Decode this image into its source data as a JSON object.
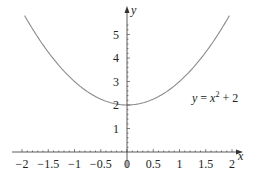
{
  "chart_data": {
    "type": "line",
    "title": "",
    "xlabel": "x",
    "ylabel": "y",
    "xlim": [
      -2,
      2
    ],
    "ylim": [
      0,
      5.7
    ],
    "grid": false,
    "legend": null,
    "x_ticks": [
      -2,
      -1.5,
      -1,
      -0.5,
      0,
      0.5,
      1,
      1.5,
      2
    ],
    "x_tick_labels": [
      "−2",
      "−1.5",
      "−1",
      "−0.5",
      "0",
      "0.5",
      "1",
      "1.5",
      "2"
    ],
    "y_ticks": [
      1,
      2,
      3,
      4,
      5
    ],
    "y_tick_labels": [
      "1",
      "2",
      "3",
      "4",
      "5"
    ],
    "series": [
      {
        "name": "y = x^2 + 2",
        "function": "x^2 + 2",
        "x": [
          -2,
          -1.5,
          -1,
          -0.5,
          0,
          0.5,
          1,
          1.5,
          2
        ],
        "values": [
          6,
          4.25,
          3,
          2.25,
          2,
          2.25,
          3,
          4.25,
          6
        ],
        "color": "#8c8c8c"
      }
    ],
    "annotations": [
      {
        "text": "y = x² + 2",
        "x": 1.4,
        "y": 2.7
      }
    ]
  },
  "colors": {
    "curve": "#8c8c8c",
    "axis": "#333333",
    "text": "#222222"
  }
}
